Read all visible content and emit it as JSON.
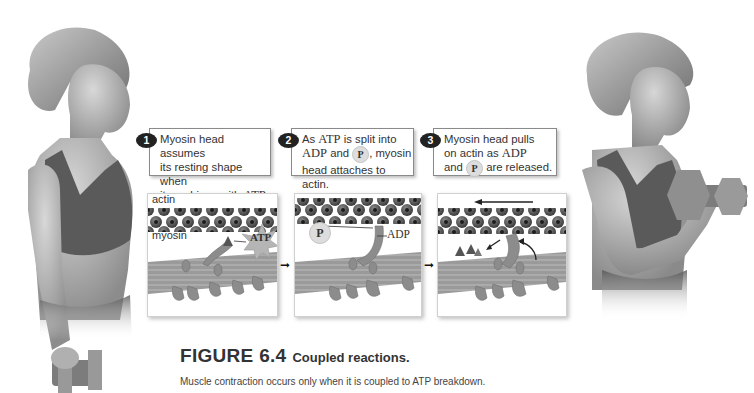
{
  "figure": {
    "label": "FIGURE 6.4",
    "title": "Coupled reactions.",
    "caption": "Muscle contraction occurs only when it is coupled to ATP breakdown."
  },
  "steps": [
    {
      "number": "1",
      "lines": [
        {
          "pre": "Myosin head assumes",
          "serif": "",
          "post": ""
        },
        {
          "pre": "its resting shape when",
          "serif": "",
          "post": ""
        },
        {
          "pre": "it combines with ",
          "serif": "ATP",
          "post": "."
        }
      ]
    },
    {
      "number": "2",
      "line1_pre": "As ",
      "line1_serif": "ATP",
      "line1_post": " is split into",
      "line2_serif": "ADP",
      "line2_mid": " and ",
      "line2_circle": "P",
      "line2_post": ", myosin",
      "line3": "head attaches to actin."
    },
    {
      "number": "3",
      "line1": "Myosin head pulls",
      "line2_pre": "on actin as ",
      "line2_serif": "ADP",
      "line3_pre": "and ",
      "line3_circle": "P",
      "line3_post": " are released."
    }
  ],
  "panels": [
    {
      "labels": {
        "actin": "actin",
        "myosin": "myosin",
        "molecule": "ATP"
      }
    },
    {
      "labels": {
        "phosphate": "P",
        "molecule": "ADP"
      }
    },
    {
      "labels": {}
    }
  ],
  "colors": {
    "actin_bead": "#4a4a4a",
    "actin_hole": "#1c1c1c",
    "myosin": "#9a9a9a",
    "myosin_head": "#8c8c8c",
    "burst": "#b5b5b5",
    "badge": "#222222"
  }
}
